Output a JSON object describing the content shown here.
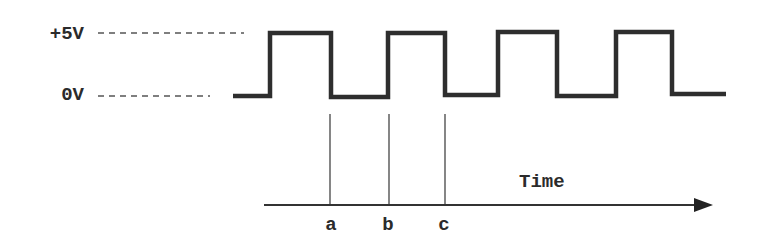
{
  "diagram": {
    "colors": {
      "signal": "#2e2e2e",
      "reference": "#555555",
      "axis": "#333333",
      "text": "#2b2b2b",
      "background": "#ffffff"
    },
    "levels": [
      {
        "id": "high",
        "label": "+5V",
        "y": 33
      },
      {
        "id": "low",
        "label": "0V",
        "y": 96
      }
    ],
    "signal": {
      "type": "square-wave",
      "points": [
        [
          233,
          96
        ],
        [
          270,
          96
        ],
        [
          270,
          33
        ],
        [
          331,
          33
        ],
        [
          331,
          97
        ],
        [
          388,
          97
        ],
        [
          388,
          33
        ],
        [
          445,
          33
        ],
        [
          445,
          95
        ],
        [
          498,
          95
        ],
        [
          498,
          32
        ],
        [
          557,
          32
        ],
        [
          557,
          96
        ],
        [
          616,
          96
        ],
        [
          616,
          32
        ],
        [
          672,
          32
        ],
        [
          672,
          94
        ],
        [
          726,
          94
        ]
      ]
    },
    "markers": [
      {
        "id": "a",
        "label": "a",
        "x": 330
      },
      {
        "id": "b",
        "label": "b",
        "x": 389
      },
      {
        "id": "c",
        "label": "c",
        "x": 445
      }
    ],
    "time_axis": {
      "label": "Time",
      "x_start": 264,
      "x_end": 713,
      "y": 205
    }
  }
}
